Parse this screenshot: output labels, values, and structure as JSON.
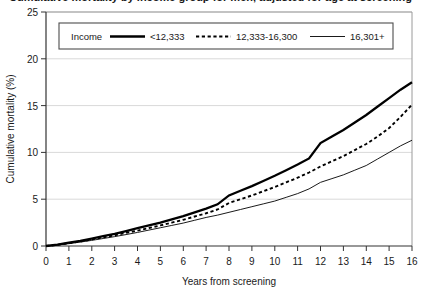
{
  "figure": {
    "title_cropped": "Cumulative mortality by income group for men, adjusted for age at screening",
    "background_color": "#ffffff",
    "frame_color": "#808080",
    "gridline_color": "#d9d9d9"
  },
  "legend": {
    "title": "Income",
    "position": "top-inside",
    "entries": [
      {
        "label": "<12,333",
        "style": "thick-solid",
        "color": "#000000"
      },
      {
        "label": "12,333-16,300",
        "style": "dashed",
        "color": "#000000"
      },
      {
        "label": "16,301+",
        "style": "thin-solid",
        "color": "#000000"
      }
    ]
  },
  "chart_data": {
    "type": "line",
    "title": "",
    "xlabel": "Years from screening",
    "ylabel": "Cumulative mortality (%)",
    "xlim": [
      0,
      16
    ],
    "ylim": [
      0,
      25
    ],
    "xticks": [
      0,
      1,
      2,
      3,
      4,
      5,
      6,
      7,
      8,
      9,
      10,
      11,
      12,
      13,
      14,
      15,
      16
    ],
    "yticks": [
      0,
      5,
      10,
      15,
      20,
      25
    ],
    "xtick_labels": [
      "0",
      "1",
      "2",
      "3",
      "4",
      "5",
      "6",
      "7",
      "8",
      "9",
      "10",
      "11",
      "12",
      "13",
      "14",
      "15",
      "16"
    ],
    "ytick_labels": [
      "0",
      "5",
      "10",
      "15",
      "20",
      "25"
    ],
    "grid": "horizontal",
    "legend_position": "top-inside",
    "x": [
      0,
      0.5,
      1,
      1.5,
      2,
      2.5,
      3,
      3.5,
      4,
      4.5,
      5,
      5.5,
      6,
      6.5,
      7,
      7.5,
      8,
      8.5,
      9,
      9.5,
      10,
      10.5,
      11,
      11.5,
      12,
      12.5,
      13,
      13.5,
      14,
      14.5,
      15,
      15.5,
      16
    ],
    "series": [
      {
        "name": "<12,333",
        "style": "thick-solid",
        "color": "#000000",
        "values": [
          0.0,
          0.15,
          0.35,
          0.55,
          0.8,
          1.05,
          1.3,
          1.6,
          1.9,
          2.2,
          2.5,
          2.85,
          3.2,
          3.6,
          4.0,
          4.45,
          5.4,
          5.9,
          6.4,
          6.95,
          7.5,
          8.1,
          8.7,
          9.35,
          11.0,
          11.7,
          12.4,
          13.2,
          14.0,
          14.9,
          15.8,
          16.7,
          17.5
        ]
      },
      {
        "name": "12,333-16,300",
        "style": "dashed",
        "color": "#000000",
        "values": [
          0.0,
          0.12,
          0.3,
          0.48,
          0.7,
          0.92,
          1.15,
          1.4,
          1.65,
          1.92,
          2.2,
          2.5,
          2.8,
          3.15,
          3.5,
          3.9,
          4.6,
          5.0,
          5.4,
          5.85,
          6.3,
          6.8,
          7.3,
          7.85,
          8.5,
          9.05,
          9.6,
          10.25,
          10.9,
          11.7,
          12.6,
          13.8,
          15.1
        ]
      },
      {
        "name": "16,301+",
        "style": "thin-solid",
        "color": "#000000",
        "values": [
          0.0,
          0.1,
          0.25,
          0.42,
          0.6,
          0.8,
          1.0,
          1.22,
          1.45,
          1.7,
          1.95,
          2.2,
          2.45,
          2.75,
          3.05,
          3.3,
          3.6,
          3.9,
          4.2,
          4.5,
          4.8,
          5.2,
          5.6,
          6.1,
          6.8,
          7.2,
          7.6,
          8.1,
          8.6,
          9.3,
          10.0,
          10.7,
          11.3
        ]
      }
    ]
  }
}
